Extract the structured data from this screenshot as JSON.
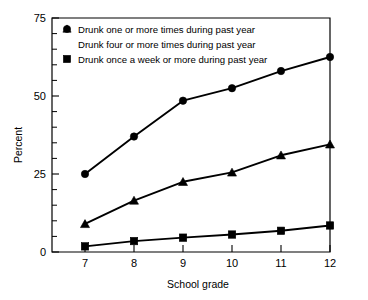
{
  "chart_data": {
    "type": "line",
    "title": "",
    "xlabel": "School grade",
    "ylabel": "Percent",
    "x": [
      7,
      8,
      9,
      10,
      11,
      12
    ],
    "xtick_labels": [
      "7",
      "8",
      "9",
      "10",
      "11",
      "12"
    ],
    "ytick_labels": [
      "0",
      "25",
      "50",
      "75"
    ],
    "yticks": [
      0,
      25,
      50,
      75
    ],
    "ylim": [
      0,
      75
    ],
    "xlim": [
      6.6,
      12.0
    ],
    "grid": false,
    "minor_tick_interval": 5,
    "legend_position": "upper-left-inside",
    "series": [
      {
        "name": "Drunk one or more times during past year",
        "marker": "circle",
        "values": [
          25,
          37,
          48.5,
          52.5,
          58,
          62.5
        ]
      },
      {
        "name": "Drunk four or more times during past year",
        "marker": "triangle",
        "values": [
          9,
          16.5,
          22.5,
          25.5,
          31,
          34.5
        ]
      },
      {
        "name": "Drunk once a week or more during past year",
        "marker": "square",
        "values": [
          1.8,
          3.5,
          4.6,
          5.6,
          6.8,
          8.5
        ]
      }
    ],
    "colors": {
      "series": "#000000",
      "axis": "#000000",
      "background": "#ffffff"
    }
  },
  "legend": {
    "entries": [
      {
        "marker_icon": "circle-marker-icon",
        "label": "Drunk one or more times during past year"
      },
      {
        "marker_icon": "triangle-marker-icon",
        "label": "Drunk four or more times during past year"
      },
      {
        "marker_icon": "square-marker-icon",
        "label": "Drunk once a week or more during past year"
      }
    ]
  },
  "axes": {
    "y_title": "Percent",
    "x_title": "School grade",
    "y_labels": [
      "75",
      "50",
      "25",
      "0"
    ],
    "x_labels": [
      "7",
      "8",
      "9",
      "10",
      "11",
      "12"
    ]
  }
}
